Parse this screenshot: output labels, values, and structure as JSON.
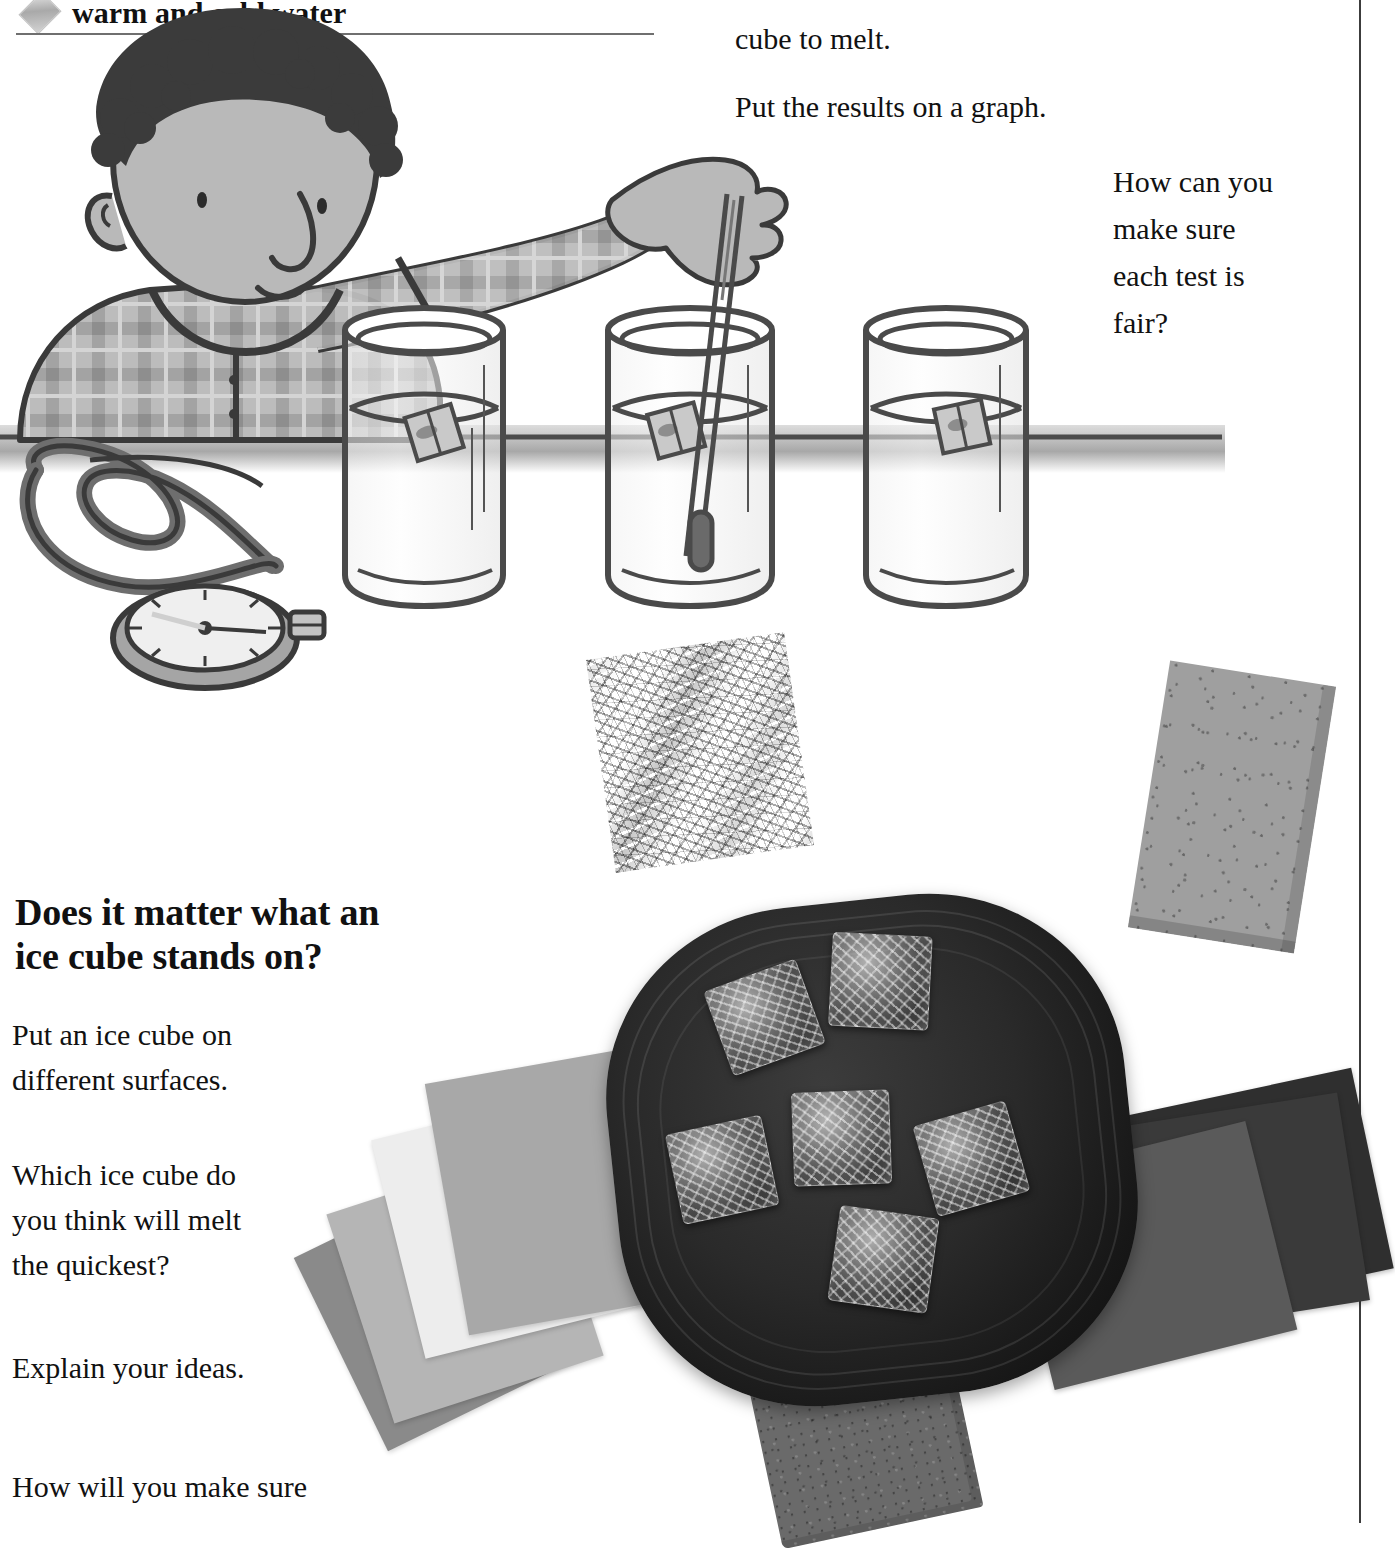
{
  "page": {
    "background_color": "#ffffff",
    "width": 1395,
    "height": 1523
  },
  "header": {
    "bullet_icon": "diamond-bullet-icon",
    "bullet_text": "warm and cold water",
    "rule_color": "#6f6f6f"
  },
  "right_column": {
    "line_cube_to_melt": "cube to melt.",
    "line_put_results": "Put the results on a graph.",
    "fair_test_question": "How can you\nmake sure\neach test is\nfair?"
  },
  "section": {
    "heading": "Does it matter what an\nice cube stands on?",
    "paragraphs": [
      "Put an ice cube on\ndifferent surfaces.",
      "Which ice cube do\nyou think will melt\nthe quickest?",
      "Explain your ideas.",
      "How will you make sure"
    ]
  },
  "illustration": {
    "caption_semantic": "boy-with-three-beakers-and-stopwatch",
    "elements": [
      "boy-figure",
      "plaid-shirt",
      "beaker-left",
      "beaker-middle",
      "beaker-right",
      "thermometer",
      "ice-cube-in-beaker",
      "stopwatch",
      "stopwatch-cord",
      "table-surface-line"
    ],
    "beaker_count": 3,
    "ice_cube_count_in_beakers": 3
  },
  "photo": {
    "tray_label": "black-tray",
    "ice_cube_count": 6,
    "surfaces": [
      {
        "name": "aluminium-foil",
        "tone": "#d8d8d8"
      },
      {
        "name": "foam-sponge",
        "tone": "#9f9f9f"
      },
      {
        "name": "paper-square-grey",
        "tone": "#a8a8a8"
      },
      {
        "name": "paper-square-light",
        "tone": "#ededed"
      },
      {
        "name": "paper-square-mid",
        "tone": "#b5b5b5"
      },
      {
        "name": "paper-square-dark",
        "tone": "#8a8a8a"
      },
      {
        "name": "card-square-dark-a",
        "tone": "#2f2f2f"
      },
      {
        "name": "card-square-dark-b",
        "tone": "#3a3a3a"
      },
      {
        "name": "card-square-grey-c",
        "tone": "#5a5a5a"
      },
      {
        "name": "brick-block",
        "tone": "#6a6a6a"
      }
    ]
  },
  "colors": {
    "text": "#111111",
    "rule": "#6f6f6f",
    "vertical_rule": "#3c3c3c",
    "tray": "#1a1a1a"
  }
}
